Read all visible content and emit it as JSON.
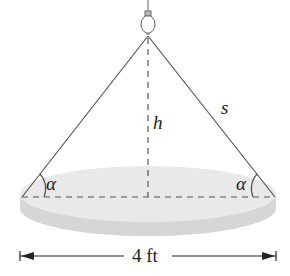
{
  "diagram": {
    "labels": {
      "height": "h",
      "slant": "s",
      "angle_left": "α",
      "angle_right": "α",
      "width": "4 ft"
    },
    "colors": {
      "line": "#555555",
      "disc": "#e6e6e6",
      "disc_edge": "#d2d2d2"
    }
  }
}
